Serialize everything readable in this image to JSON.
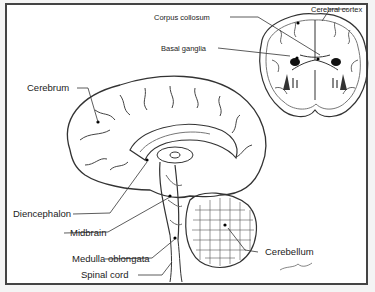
{
  "figure": {
    "views": [
      "sagittal-section",
      "coronal-section"
    ],
    "labels": {
      "corpus_collosum": "Corpus collosum",
      "cerebral_cortex": "Cerebral cortex",
      "basal_ganglia": "Basal ganglia",
      "cerebrum": "Cerebrum",
      "diencephalon": "Diencephalon",
      "midbrain": "Midbrain",
      "medulla_oblongata": "Medulla oblongata",
      "spinal_cord": "Spinal cord",
      "cerebellum": "Cerebellum"
    },
    "colors": {
      "line": "#333333",
      "fill_dark": "#111111",
      "background": "#ffffff",
      "frame": "#444444"
    }
  }
}
